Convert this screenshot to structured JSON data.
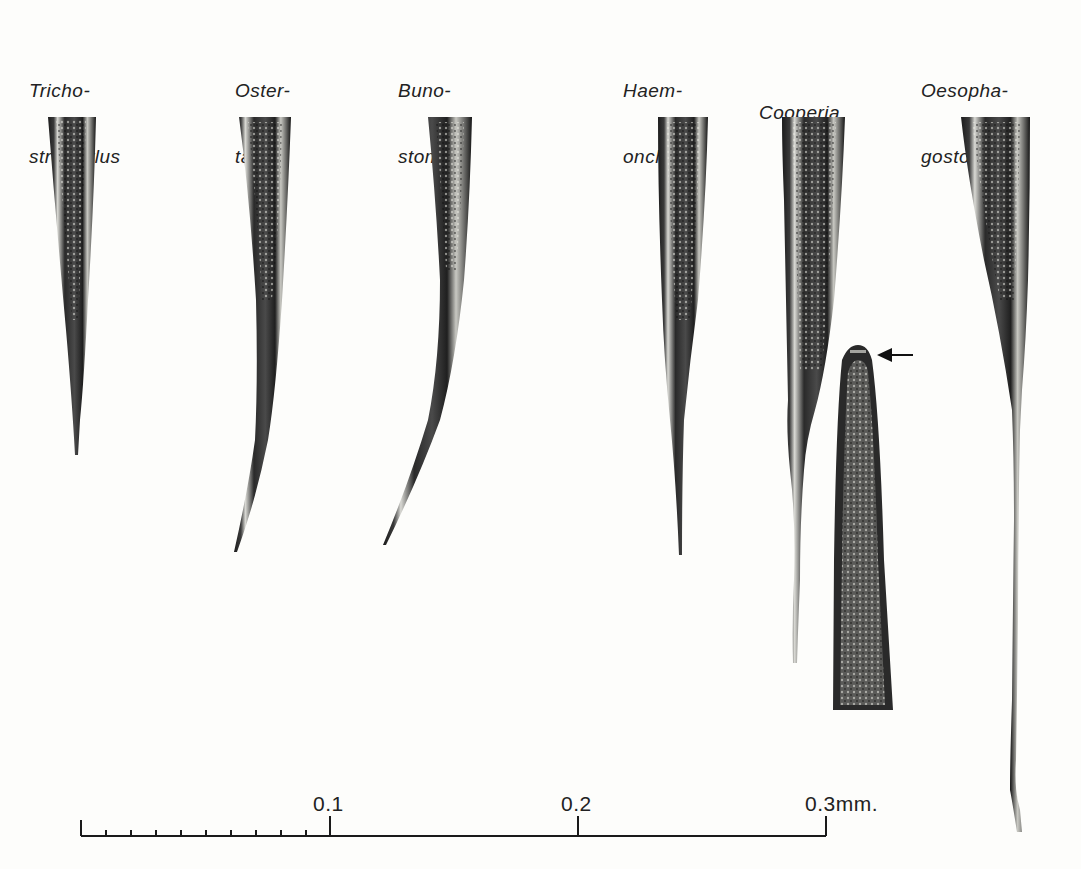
{
  "figure": {
    "type": "microscopy-plate",
    "background_color": "#fdfdfb",
    "ink_color": "#1e1e1e"
  },
  "specimens": [
    {
      "line1": "Tricho-",
      "line2": "strongylus",
      "genus": "Trichostrongylus"
    },
    {
      "line1": "Oster-",
      "line2": "tagia",
      "genus": "Ostertagia"
    },
    {
      "line1": "Buno-",
      "line2": "stomum",
      "genus": "Bunostomum"
    },
    {
      "line1": "Haem-",
      "line2": "onchus",
      "genus": "Haemonchus"
    },
    {
      "line1": "",
      "line2": "Cooperia",
      "genus": "Cooperia"
    },
    {
      "line1": "Oesopha-",
      "line2": "gostomum",
      "genus": "Oesophagostomum"
    }
  ],
  "inset": {
    "description": "Cooperia anterior end, arrow indicating head structure",
    "arrow": "left-arrow"
  },
  "scale_bar": {
    "unit": "mm.",
    "labels": [
      "0.1",
      "0.2",
      "0.3"
    ],
    "label_3_with_unit": "0.3mm.",
    "minor_ticks_in_first_segment": 10,
    "range_mm": [
      0,
      0.3
    ]
  }
}
